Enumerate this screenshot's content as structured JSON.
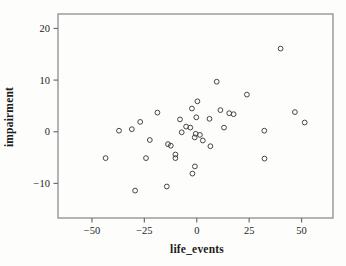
{
  "page": {
    "background": "#fdfdfc"
  },
  "chart_data": {
    "type": "scatter",
    "title": "",
    "xlabel": "life_events",
    "ylabel": "impairment",
    "grid": false,
    "legend": null,
    "marker": "open-circle",
    "marker_color": "#454545",
    "frame_color": "#8e8e8e",
    "tick_color": "#6f6f6f",
    "xlim": [
      -66.2,
      65.0
    ],
    "ylim": [
      -16.7,
      22.8
    ],
    "x_ticks": [
      {
        "v": -50,
        "label": "−50"
      },
      {
        "v": -25,
        "label": "−25"
      },
      {
        "v": 0,
        "label": "0"
      },
      {
        "v": 25,
        "label": "25"
      },
      {
        "v": 50,
        "label": "50"
      }
    ],
    "y_ticks": [
      {
        "v": -10,
        "label": "−10"
      },
      {
        "v": 0,
        "label": "0"
      },
      {
        "v": 10,
        "label": "10"
      },
      {
        "v": 20,
        "label": "20"
      }
    ],
    "points": [
      [
        40.0,
        16.1
      ],
      [
        9.5,
        9.7
      ],
      [
        23.9,
        7.2
      ],
      [
        0.3,
        5.9
      ],
      [
        -2.3,
        4.5
      ],
      [
        11.3,
        4.2
      ],
      [
        46.8,
        3.8
      ],
      [
        15.5,
        3.6
      ],
      [
        17.6,
        3.4
      ],
      [
        -18.8,
        3.7
      ],
      [
        -0.2,
        2.8
      ],
      [
        6.1,
        2.5
      ],
      [
        -8.0,
        2.4
      ],
      [
        -27.0,
        1.9
      ],
      [
        51.5,
        1.8
      ],
      [
        -5.1,
        1.0
      ],
      [
        -3.1,
        0.8
      ],
      [
        13.0,
        0.8
      ],
      [
        -37.1,
        0.2
      ],
      [
        -31.0,
        0.5
      ],
      [
        -7.2,
        -0.1
      ],
      [
        32.2,
        0.2
      ],
      [
        -0.5,
        -0.4
      ],
      [
        1.5,
        -0.6
      ],
      [
        -1.0,
        -1.1
      ],
      [
        2.9,
        -1.7
      ],
      [
        -22.4,
        -1.6
      ],
      [
        6.5,
        -2.8
      ],
      [
        -13.7,
        -2.4
      ],
      [
        -12.4,
        -2.7
      ],
      [
        -10.2,
        -4.4
      ],
      [
        -10.2,
        -5.1
      ],
      [
        -43.5,
        -5.1
      ],
      [
        -24.2,
        -5.1
      ],
      [
        32.3,
        -5.2
      ],
      [
        -0.9,
        -6.7
      ],
      [
        -2.1,
        -8.1
      ],
      [
        -14.3,
        -10.6
      ],
      [
        -29.4,
        -11.4
      ]
    ]
  }
}
